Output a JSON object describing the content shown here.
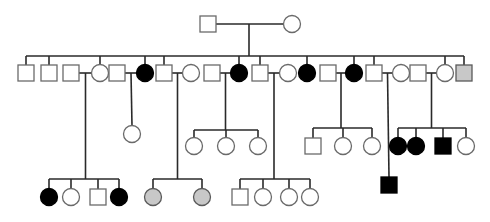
{
  "diagram": {
    "type": "pedigree",
    "legend_colors": {
      "unaffected": "#ffffff",
      "affected": "#000000",
      "partial": "#c8c8c8"
    },
    "generations": [
      {
        "id": "I",
        "individuals": [
          {
            "id": "I-1",
            "sex": "male",
            "status": "unaffected"
          },
          {
            "id": "I-2",
            "sex": "female",
            "status": "unaffected"
          }
        ],
        "couples": [
          [
            "I-1",
            "I-2"
          ]
        ]
      },
      {
        "id": "II",
        "individuals": [
          {
            "id": "II-1",
            "sex": "male",
            "status": "unaffected",
            "parents": "I"
          },
          {
            "id": "II-2",
            "sex": "male",
            "status": "unaffected",
            "parents": "I"
          },
          {
            "id": "II-3",
            "sex": "male",
            "status": "unaffected",
            "spouse": true
          },
          {
            "id": "II-4",
            "sex": "female",
            "status": "unaffected",
            "parents": "I"
          },
          {
            "id": "II-5",
            "sex": "male",
            "status": "unaffected",
            "spouse": true
          },
          {
            "id": "II-6",
            "sex": "female",
            "status": "affected",
            "parents": "I"
          },
          {
            "id": "II-7",
            "sex": "male",
            "status": "unaffected",
            "parents": "I"
          },
          {
            "id": "II-8",
            "sex": "female",
            "status": "unaffected",
            "spouse": true
          },
          {
            "id": "II-9",
            "sex": "male",
            "status": "unaffected",
            "spouse": true
          },
          {
            "id": "II-10",
            "sex": "female",
            "status": "affected",
            "parents": "I"
          },
          {
            "id": "II-11",
            "sex": "male",
            "status": "unaffected",
            "parents": "I"
          },
          {
            "id": "II-12",
            "sex": "female",
            "status": "unaffected",
            "spouse": true
          },
          {
            "id": "II-13",
            "sex": "female",
            "status": "affected",
            "parents": "I"
          },
          {
            "id": "II-14",
            "sex": "male",
            "status": "unaffected",
            "spouse": true
          },
          {
            "id": "II-15",
            "sex": "female",
            "status": "affected",
            "parents": "I"
          },
          {
            "id": "II-16",
            "sex": "male",
            "status": "unaffected",
            "parents": "I"
          },
          {
            "id": "II-17",
            "sex": "female",
            "status": "unaffected",
            "spouse": true
          },
          {
            "id": "II-18",
            "sex": "male",
            "status": "unaffected",
            "spouse": true
          },
          {
            "id": "II-19",
            "sex": "female",
            "status": "unaffected",
            "parents": "I"
          },
          {
            "id": "II-20",
            "sex": "male",
            "status": "partial",
            "parents": "I"
          }
        ],
        "couples": [
          [
            "II-3",
            "II-4"
          ],
          [
            "II-5",
            "II-6"
          ],
          [
            "II-7",
            "II-8"
          ],
          [
            "II-9",
            "II-10"
          ],
          [
            "II-11",
            "II-12"
          ],
          [
            "II-14",
            "II-15"
          ],
          [
            "II-16",
            "II-17"
          ],
          [
            "II-18",
            "II-19"
          ]
        ]
      },
      {
        "id": "III",
        "individuals": [
          {
            "id": "III-1",
            "sex": "female",
            "status": "unaffected",
            "parents": [
              "II-5",
              "II-6"
            ]
          },
          {
            "id": "III-2",
            "sex": "female",
            "status": "unaffected",
            "parents": [
              "II-9",
              "II-10"
            ]
          },
          {
            "id": "III-3",
            "sex": "female",
            "status": "unaffected",
            "parents": [
              "II-9",
              "II-10"
            ]
          },
          {
            "id": "III-4",
            "sex": "female",
            "status": "unaffected",
            "parents": [
              "II-9",
              "II-10"
            ]
          },
          {
            "id": "III-5",
            "sex": "male",
            "status": "unaffected",
            "parents": [
              "II-14",
              "II-15"
            ]
          },
          {
            "id": "III-6",
            "sex": "female",
            "status": "unaffected",
            "parents": [
              "II-14",
              "II-15"
            ]
          },
          {
            "id": "III-7",
            "sex": "female",
            "status": "unaffected",
            "parents": [
              "II-14",
              "II-15"
            ]
          },
          {
            "id": "III-8",
            "sex": "female",
            "status": "affected",
            "parents": [
              "II-18",
              "II-19"
            ]
          },
          {
            "id": "III-9",
            "sex": "female",
            "status": "affected",
            "parents": [
              "II-18",
              "II-19"
            ]
          },
          {
            "id": "III-10",
            "sex": "male",
            "status": "affected",
            "parents": [
              "II-18",
              "II-19"
            ]
          },
          {
            "id": "III-11",
            "sex": "female",
            "status": "unaffected",
            "parents": [
              "II-18",
              "II-19"
            ]
          },
          {
            "id": "III-12",
            "sex": "male",
            "status": "affected",
            "parents": [
              "II-16",
              "II-17"
            ]
          }
        ]
      },
      {
        "id": "IV",
        "individuals": [
          {
            "id": "IV-1",
            "sex": "female",
            "status": "affected",
            "parents": [
              "II-3",
              "II-4"
            ]
          },
          {
            "id": "IV-2",
            "sex": "female",
            "status": "unaffected",
            "parents": [
              "II-3",
              "II-4"
            ]
          },
          {
            "id": "IV-3",
            "sex": "male",
            "status": "unaffected",
            "parents": [
              "II-3",
              "II-4"
            ]
          },
          {
            "id": "IV-4",
            "sex": "female",
            "status": "affected",
            "parents": [
              "II-3",
              "II-4"
            ]
          },
          {
            "id": "IV-5",
            "sex": "female",
            "status": "partial",
            "parents": [
              "II-7",
              "II-8"
            ]
          },
          {
            "id": "IV-6",
            "sex": "female",
            "status": "partial",
            "parents": [
              "II-7",
              "II-8"
            ]
          },
          {
            "id": "IV-7",
            "sex": "male",
            "status": "unaffected",
            "parents": [
              "II-11",
              "II-12"
            ]
          },
          {
            "id": "IV-8",
            "sex": "female",
            "status": "unaffected",
            "parents": [
              "II-11",
              "II-12"
            ]
          },
          {
            "id": "IV-9",
            "sex": "female",
            "status": "unaffected",
            "parents": [
              "II-11",
              "II-12"
            ]
          },
          {
            "id": "IV-10",
            "sex": "female",
            "status": "unaffected",
            "parents": [
              "II-11",
              "II-12"
            ]
          }
        ]
      }
    ]
  }
}
